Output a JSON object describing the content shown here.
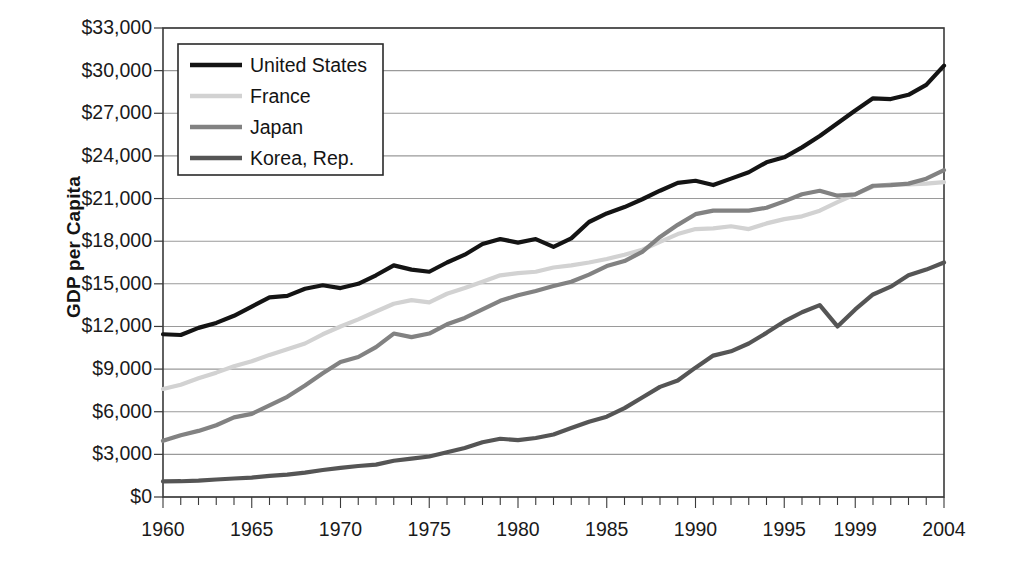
{
  "chart_data": {
    "type": "line",
    "title": "",
    "xlabel": "",
    "ylabel": "GDP per Capita",
    "xlim": [
      1960,
      2004
    ],
    "ylim": [
      0,
      33000
    ],
    "y_tick_step": 3000,
    "grid": true,
    "legend_position": "top-left-inside",
    "y_tick_labels": [
      "$33,000",
      "$30,000",
      "$27,000",
      "$24,000",
      "$21,000",
      "$18,000",
      "$15,000",
      "$12,000",
      "$9,000",
      "$6,000",
      "$3,000",
      "$0"
    ],
    "x_tick_labels": [
      "1960",
      "1965",
      "1970",
      "1975",
      "1980",
      "1985",
      "1990",
      "1995",
      "1999",
      "2004"
    ],
    "x_tick_values": [
      1960,
      1965,
      1970,
      1975,
      1980,
      1985,
      1990,
      1995,
      1999,
      2004
    ],
    "x": [
      1960,
      1961,
      1962,
      1963,
      1964,
      1965,
      1966,
      1967,
      1968,
      1969,
      1970,
      1971,
      1972,
      1973,
      1974,
      1975,
      1976,
      1977,
      1978,
      1979,
      1980,
      1981,
      1982,
      1983,
      1984,
      1985,
      1986,
      1987,
      1988,
      1989,
      1990,
      1991,
      1992,
      1993,
      1994,
      1995,
      1996,
      1997,
      1998,
      1999,
      2000,
      2001,
      2002,
      2003,
      2004
    ],
    "series": [
      {
        "name": "United States",
        "color": "#141414",
        "width": 4.2,
        "values": [
          11450,
          11400,
          11900,
          12250,
          12750,
          13400,
          14050,
          14150,
          14650,
          14900,
          14700,
          15000,
          15600,
          16300,
          16000,
          15850,
          16500,
          17050,
          17800,
          18150,
          17900,
          18150,
          17600,
          18200,
          19350,
          19950,
          20400,
          20950,
          21550,
          22100,
          22250,
          21950,
          22400,
          22850,
          23550,
          23900,
          24600,
          25400,
          26300,
          27200,
          28050,
          28000,
          28300,
          29000,
          30350
        ]
      },
      {
        "name": "France",
        "color": "#d2d2d2",
        "width": 4.2,
        "values": [
          7600,
          7900,
          8350,
          8750,
          9200,
          9550,
          10000,
          10400,
          10800,
          11450,
          12000,
          12500,
          13050,
          13600,
          13850,
          13700,
          14300,
          14700,
          15150,
          15600,
          15750,
          15850,
          16150,
          16300,
          16500,
          16750,
          17050,
          17400,
          17950,
          18500,
          18850,
          18900,
          19050,
          18850,
          19250,
          19550,
          19750,
          20150,
          20750,
          21300,
          21850,
          22000,
          22000,
          22050,
          22150
        ]
      },
      {
        "name": "Japan",
        "color": "#828282",
        "width": 4.2,
        "values": [
          3950,
          4350,
          4650,
          5050,
          5600,
          5850,
          6450,
          7050,
          7850,
          8700,
          9500,
          9850,
          10550,
          11500,
          11250,
          11500,
          12150,
          12600,
          13200,
          13800,
          14200,
          14500,
          14850,
          15150,
          15650,
          16250,
          16600,
          17250,
          18300,
          19150,
          19900,
          20150,
          20150,
          20150,
          20350,
          20800,
          21300,
          21550,
          21200,
          21300,
          21900,
          21950,
          22050,
          22400,
          23000
        ]
      },
      {
        "name": "Korea, Rep.",
        "color": "#555555",
        "width": 4.2,
        "values": [
          1100,
          1110,
          1150,
          1230,
          1300,
          1360,
          1490,
          1580,
          1720,
          1900,
          2050,
          2180,
          2280,
          2550,
          2700,
          2850,
          3150,
          3450,
          3850,
          4100,
          4000,
          4150,
          4400,
          4850,
          5300,
          5650,
          6250,
          7000,
          7750,
          8200,
          9100,
          9950,
          10250,
          10800,
          11550,
          12350,
          13000,
          13500,
          12000,
          13200,
          14250,
          14800,
          15600,
          16000,
          16500
        ]
      }
    ]
  },
  "legend": {
    "entries": [
      {
        "label": "United States",
        "color": "#141414"
      },
      {
        "label": "France",
        "color": "#d2d2d2"
      },
      {
        "label": "Japan",
        "color": "#828282"
      },
      {
        "label": "Korea, Rep.",
        "color": "#555555"
      }
    ]
  },
  "axis": {
    "y_title": "GDP per Capita",
    "y_ticks": [
      "$33,000",
      "$30,000",
      "$27,000",
      "$24,000",
      "$21,000",
      "$18,000",
      "$15,000",
      "$12,000",
      "$9,000",
      "$6,000",
      "$3,000",
      "$0"
    ],
    "x_ticks": [
      "1960",
      "1965",
      "1970",
      "1975",
      "1980",
      "1985",
      "1990",
      "1995",
      "1999",
      "2004"
    ]
  },
  "colors": {
    "plot_border": "#3a3a3a",
    "gridline": "#9a9a9a",
    "background": "#ffffff",
    "text": "#1a1a1a"
  }
}
